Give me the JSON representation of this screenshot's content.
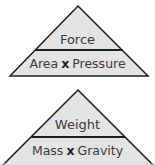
{
  "colors": {
    "fill": "#e4e4e4",
    "stroke": "#1e1e1e",
    "text": "#3a3a3a"
  },
  "triangles": [
    {
      "top": "Force",
      "left": "Area",
      "operator": "x",
      "right": "Pressure"
    },
    {
      "top": "Weight",
      "left": "Mass",
      "operator": "x",
      "right": "Gravity"
    }
  ]
}
